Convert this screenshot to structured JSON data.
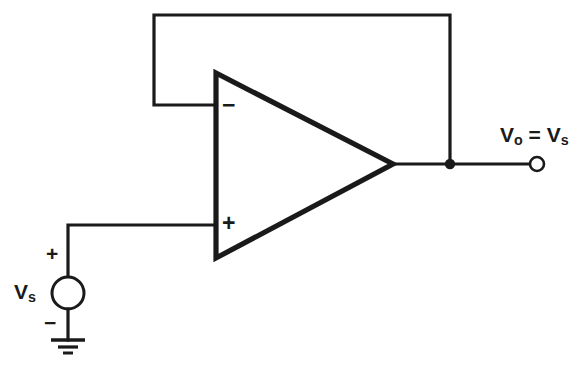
{
  "diagram": {
    "background_color": "#ffffff",
    "line_color": "#1a1a1a",
    "width": 586,
    "height": 373
  },
  "opamp": {
    "name": "operational-amplifier",
    "inverting_input_label": "−",
    "noninverting_input_label": "+",
    "inverting_input_position": {
      "x": 216,
      "y": 105
    },
    "noninverting_input_position": {
      "x": 216,
      "y": 225
    },
    "output_position": {
      "x": 393,
      "y": 164
    },
    "triangle_points": "216,73 216,258 393,164"
  },
  "feedback": {
    "name": "feedback-wire",
    "description": "output shorted to inverting input",
    "path": "M 450 164 L 450 15 L 154 15 L 154 105 L 216 105"
  },
  "source": {
    "name": "independent-voltage-source",
    "label": "V",
    "label_sub": "s",
    "plus_label": "+",
    "minus_label": "−",
    "center": {
      "x": 68,
      "y": 293
    },
    "radius": 16,
    "input_wire_path": "M 216 225 L 68 225 L 68 277"
  },
  "ground": {
    "name": "ground-symbol",
    "stem_path": "M 68 309 L 68 340",
    "bars": [
      {
        "y": 340,
        "half_width": 17,
        "thickness": 3.4
      },
      {
        "y": 347,
        "half_width": 10,
        "thickness": 3.2
      },
      {
        "y": 353,
        "half_width": 5,
        "thickness": 3.0
      }
    ]
  },
  "output": {
    "name": "output-node",
    "wire_path": "M 393 164 L 530 164",
    "junction_dot": {
      "x": 450,
      "y": 164,
      "r": 5.2
    },
    "terminal_circle": {
      "x": 537,
      "y": 164,
      "r": 7
    },
    "label_v": "V",
    "label_v_sub": "o",
    "label_equals": " = ",
    "label_v2": "V",
    "label_v2_sub": "s",
    "label_full": "Vo = Vs"
  }
}
